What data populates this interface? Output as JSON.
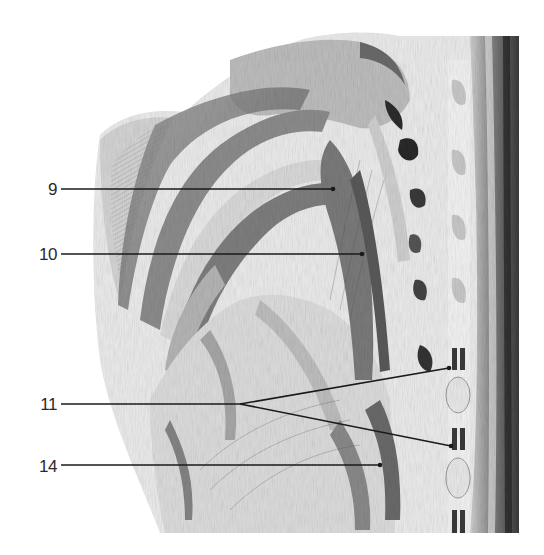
{
  "figure": {
    "style": "grayscale pencil drawing",
    "callouts": [
      {
        "label": "9",
        "label_x": 27,
        "label_y": 181,
        "line": [
          [
            61,
            189
          ],
          [
            333,
            189
          ]
        ]
      },
      {
        "label": "10",
        "label_x": 27,
        "label_y": 246,
        "line": [
          [
            61,
            254
          ],
          [
            362,
            254
          ]
        ]
      },
      {
        "label": "11",
        "label_x": 27,
        "label_y": 396,
        "line": [
          [
            61,
            404
          ],
          [
            240,
            404
          ]
        ],
        "branches": [
          [
            [
              240,
              404
            ],
            [
              449,
              368
            ]
          ],
          [
            [
              240,
              404
            ],
            [
              451,
              446
            ]
          ]
        ]
      },
      {
        "label": "14",
        "label_x": 27,
        "label_y": 458,
        "line": [
          [
            61,
            465
          ],
          [
            380,
            465
          ]
        ]
      }
    ],
    "colors": {
      "background": "#ffffff",
      "line": "#1a1a1a",
      "label": "#2a2a2a",
      "shade_light": "#d8d8d8",
      "shade_mid": "#9a9a9a",
      "shade_dark": "#3c3c3c"
    }
  }
}
